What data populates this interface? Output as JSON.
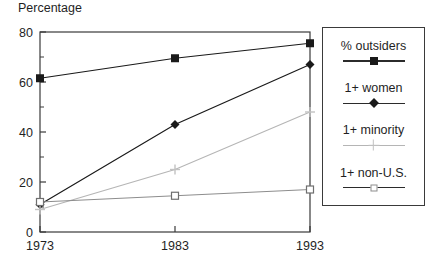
{
  "ylabel_text": "Percentage",
  "clipped_header": "",
  "legend": {
    "entries": [
      {
        "label": "% outsiders",
        "marker": "filled-square-marker",
        "color": "#1a1a1a"
      },
      {
        "label": "1+ women",
        "marker": "filled-diamond-marker",
        "color": "#1a1a1a"
      },
      {
        "label": "1+ minority",
        "marker": "faint-plus-marker",
        "color": "#c2c2c2"
      },
      {
        "label": "1+ non-U.S.",
        "marker": "open-square-marker",
        "color": "#8d8d8d"
      }
    ]
  },
  "chart_data": {
    "type": "line",
    "title": "",
    "xlabel": "",
    "ylabel": "Percentage",
    "categories": [
      "1973",
      "1983",
      "1993"
    ],
    "x": [
      1973,
      1983,
      1993
    ],
    "xlim": [
      1973,
      1993
    ],
    "ylim": [
      0,
      80
    ],
    "yticks": [
      0,
      20,
      40,
      60,
      80
    ],
    "yticks_minor": [
      10,
      30,
      50,
      70
    ],
    "xticks": [
      1973,
      1983,
      1993
    ],
    "grid": false,
    "legend_position": "right-outside",
    "series": [
      {
        "name": "% outsiders",
        "values": [
          61.5,
          69.5,
          75.5
        ],
        "marker": "filled-square",
        "color": "#1a1a1a"
      },
      {
        "name": "1+ women",
        "values": [
          11.0,
          43.0,
          67.0
        ],
        "marker": "filled-diamond",
        "color": "#1a1a1a"
      },
      {
        "name": "1+ minority",
        "values": [
          9.0,
          25.0,
          48.0
        ],
        "marker": "faint-plus",
        "color": "#b5b5b5"
      },
      {
        "name": "1+ non-U.S.",
        "values": [
          12.0,
          14.5,
          17.0
        ],
        "marker": "open-square",
        "color": "#8d8d8d"
      }
    ]
  }
}
